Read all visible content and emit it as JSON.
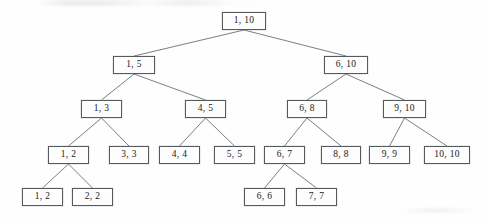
{
  "diagram": {
    "type": "binary-tree",
    "width": 484,
    "height": 219,
    "box_width": 43,
    "box_height": 18,
    "line_color": "#6b7075",
    "box_border_color": "#555a5e",
    "background_color": "#fefefe",
    "text_color": "#1a1a1a",
    "levels": [
      {
        "index": 0,
        "y": 12,
        "nodes": [
          {
            "id": "n1",
            "label": "1, 10",
            "x": 222,
            "w": 44
          }
        ]
      },
      {
        "index": 1,
        "y": 56,
        "nodes": [
          {
            "id": "n2",
            "label": "1, 5",
            "x": 113,
            "w": 42
          },
          {
            "id": "n3",
            "label": "6, 10",
            "x": 324,
            "w": 44
          }
        ]
      },
      {
        "index": 2,
        "y": 100,
        "nodes": [
          {
            "id": "n4",
            "label": "1, 3",
            "x": 81,
            "w": 41
          },
          {
            "id": "n5",
            "label": "4, 5",
            "x": 185,
            "w": 41
          },
          {
            "id": "n6",
            "label": "6, 8",
            "x": 287,
            "w": 40
          },
          {
            "id": "n7",
            "label": "9, 10",
            "x": 383,
            "w": 43
          }
        ]
      },
      {
        "index": 3,
        "y": 146,
        "nodes": [
          {
            "id": "n8",
            "label": "1, 2",
            "x": 48,
            "w": 41
          },
          {
            "id": "n9",
            "label": "3, 3",
            "x": 109,
            "w": 40
          },
          {
            "id": "n10",
            "label": "4, 4",
            "x": 159,
            "w": 41
          },
          {
            "id": "n11",
            "label": "5, 5",
            "x": 214,
            "w": 41
          },
          {
            "id": "n12",
            "label": "6, 7",
            "x": 264,
            "w": 41
          },
          {
            "id": "n13",
            "label": "8, 8",
            "x": 321,
            "w": 40
          },
          {
            "id": "n14",
            "label": "9, 9",
            "x": 369,
            "w": 41
          },
          {
            "id": "n15",
            "label": "10, 10",
            "x": 424,
            "w": 46
          }
        ]
      },
      {
        "index": 4,
        "y": 188,
        "nodes": [
          {
            "id": "n16",
            "label": "1, 2",
            "x": 22,
            "w": 41
          },
          {
            "id": "n17",
            "label": "2, 2",
            "x": 72,
            "w": 41
          },
          {
            "id": "n18",
            "label": "6, 6",
            "x": 244,
            "w": 41
          },
          {
            "id": "n19",
            "label": "7, 7",
            "x": 296,
            "w": 41
          }
        ]
      }
    ],
    "edges": [
      {
        "from": "n1",
        "to": "n2"
      },
      {
        "from": "n1",
        "to": "n3"
      },
      {
        "from": "n2",
        "to": "n4"
      },
      {
        "from": "n2",
        "to": "n5"
      },
      {
        "from": "n3",
        "to": "n6"
      },
      {
        "from": "n3",
        "to": "n7"
      },
      {
        "from": "n4",
        "to": "n8"
      },
      {
        "from": "n4",
        "to": "n9"
      },
      {
        "from": "n5",
        "to": "n10"
      },
      {
        "from": "n5",
        "to": "n11"
      },
      {
        "from": "n6",
        "to": "n12"
      },
      {
        "from": "n6",
        "to": "n13"
      },
      {
        "from": "n7",
        "to": "n14"
      },
      {
        "from": "n7",
        "to": "n15"
      },
      {
        "from": "n8",
        "to": "n16"
      },
      {
        "from": "n8",
        "to": "n17"
      },
      {
        "from": "n12",
        "to": "n18"
      },
      {
        "from": "n12",
        "to": "n19"
      }
    ]
  }
}
